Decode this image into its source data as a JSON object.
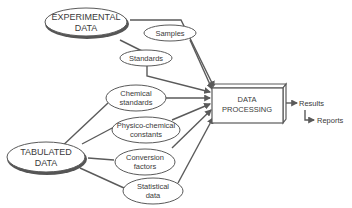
{
  "diagram": {
    "colors": {
      "stroke": "#5a5a5a",
      "shadow": "#555555",
      "text": "#3a3a3a",
      "background": "#ffffff"
    },
    "sources": [
      {
        "id": "experimental",
        "lines": [
          "EXPERIMENTAL",
          "DATA"
        ]
      },
      {
        "id": "tabulated",
        "lines": [
          "TABULATED",
          "DATA"
        ]
      }
    ],
    "inputs": [
      {
        "id": "samples",
        "lines": [
          "Samples"
        ],
        "source": "experimental"
      },
      {
        "id": "standards",
        "lines": [
          "Standards"
        ],
        "source": "experimental"
      },
      {
        "id": "chemical-standards",
        "lines": [
          "Chemical",
          "standards"
        ],
        "source": "tabulated"
      },
      {
        "id": "physico-chemical-constants",
        "lines": [
          "Physico-chemical",
          "constants"
        ],
        "source": "tabulated"
      },
      {
        "id": "conversion-factors",
        "lines": [
          "Conversion",
          "factors"
        ],
        "source": "tabulated"
      },
      {
        "id": "statistical-data",
        "lines": [
          "Statistical",
          "data"
        ],
        "source": "tabulated"
      }
    ],
    "processor": {
      "lines": [
        "DATA",
        "PROCESSING"
      ]
    },
    "outputs": [
      {
        "id": "results",
        "label": "Results"
      },
      {
        "id": "reports",
        "label": "Reports"
      }
    ]
  }
}
